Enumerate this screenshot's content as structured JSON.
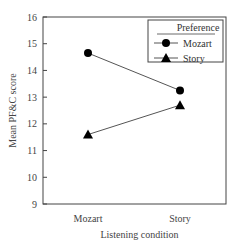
{
  "chart_data": {
    "type": "line",
    "title": "",
    "xlabel": "Listening condition",
    "ylabel": "Mean PF&C score",
    "categories": [
      "Mozart",
      "Story"
    ],
    "ylim": [
      9,
      16
    ],
    "yticks": [
      9,
      10,
      11,
      12,
      13,
      14,
      15,
      16
    ],
    "grid": false,
    "legend": {
      "title": "Preference",
      "position": "upper right",
      "entries": [
        "Mozart",
        "Story"
      ]
    },
    "series": [
      {
        "name": "Mozart",
        "marker": "circle",
        "values": [
          14.65,
          13.25
        ]
      },
      {
        "name": "Story",
        "marker": "triangle",
        "values": [
          11.6,
          12.7
        ]
      }
    ]
  },
  "axis": {
    "ylabel": "Mean PF&C score",
    "xlabel": "Listening condition",
    "yticks": [
      "9",
      "10",
      "11",
      "12",
      "13",
      "14",
      "15",
      "16"
    ],
    "xticks": [
      "Mozart",
      "Story"
    ]
  },
  "legend": {
    "title": "Preference",
    "items": [
      "Mozart",
      "Story"
    ]
  },
  "colors": {
    "line": "#555555",
    "marker": "#000000",
    "frame": "#444444"
  }
}
